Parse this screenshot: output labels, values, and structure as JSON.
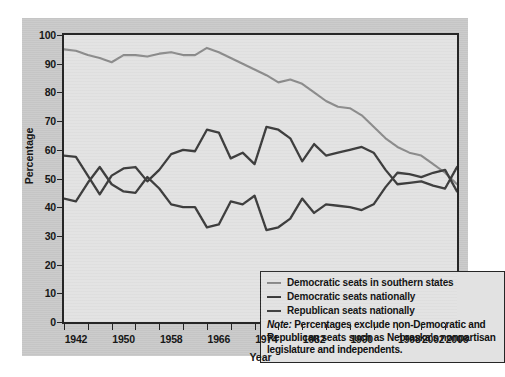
{
  "chart_data": {
    "type": "line",
    "title": "",
    "xlabel": "Year",
    "ylabel": "Percentage",
    "xlim": [
      1940,
      2006
    ],
    "ylim": [
      0,
      100
    ],
    "yticks": [
      0,
      10,
      20,
      30,
      40,
      50,
      60,
      70,
      80,
      90,
      100
    ],
    "ytick_labels": [
      "0",
      "10",
      "20",
      "30",
      "40",
      "50",
      "60",
      "70",
      "80",
      "90",
      "100"
    ],
    "xticks": [
      1940,
      1944,
      1948,
      1952,
      1956,
      1960,
      1964,
      1968,
      1972,
      1976,
      1980,
      1984,
      1988,
      1992,
      1996,
      2000,
      2004
    ],
    "xtick_labels": [
      {
        "year": 1942,
        "label": "1942"
      },
      {
        "year": 1950,
        "label": "1950"
      },
      {
        "year": 1958,
        "label": "1958"
      },
      {
        "year": 1966,
        "label": "1966"
      },
      {
        "year": 1974,
        "label": "1974"
      },
      {
        "year": 1982,
        "label": "1982"
      },
      {
        "year": 1990,
        "label": "1990"
      },
      {
        "year": 1998,
        "label": "1998"
      },
      {
        "year": 2002,
        "label": "2002"
      },
      {
        "year": 2006,
        "label": "2006"
      }
    ],
    "grid": false,
    "legend_position": "inside-bottom-right",
    "x": [
      1940,
      1942,
      1944,
      1946,
      1948,
      1950,
      1952,
      1954,
      1956,
      1958,
      1960,
      1962,
      1964,
      1966,
      1968,
      1970,
      1972,
      1974,
      1976,
      1978,
      1980,
      1982,
      1984,
      1986,
      1988,
      1990,
      1992,
      1994,
      1996,
      1998,
      2000,
      2002,
      2004,
      2006
    ],
    "series": [
      {
        "name": "Democratic seats in southern states",
        "color": "#8a8a8a",
        "values": [
          95,
          94.5,
          93,
          92,
          90.5,
          93,
          93,
          92.5,
          93.5,
          94,
          93,
          93,
          95.5,
          94,
          92,
          90,
          88,
          86,
          83.5,
          84.5,
          83,
          80,
          77,
          75,
          74.5,
          72,
          68,
          64,
          61,
          59,
          58,
          55,
          52,
          48
        ]
      },
      {
        "name": "Democratic seats nationally",
        "color": "#3a3a3a",
        "values": [
          58,
          57.5,
          51,
          44.5,
          51,
          53.5,
          54,
          49,
          53,
          58.5,
          60,
          59.5,
          67,
          66,
          57,
          59,
          55,
          68,
          67,
          64,
          56,
          62,
          58,
          59,
          60,
          61,
          59,
          53,
          48,
          48.5,
          49,
          47.5,
          46.5,
          54
        ]
      },
      {
        "name": "Republican seats nationally",
        "color": "#3a3a3a",
        "values": [
          43,
          42,
          48.5,
          54,
          48,
          45.5,
          45,
          50.5,
          46.5,
          41,
          40,
          40,
          33,
          34,
          42,
          41,
          44,
          32,
          33,
          36,
          43,
          38,
          41,
          40.5,
          40,
          39,
          41,
          47,
          52,
          51.5,
          50.5,
          52,
          53,
          45.5
        ]
      }
    ],
    "note_prefix": "Note:",
    "note_text": " Percentages exclude non-Democratic and Republican seats such as Nebraska's nonpartisan legislature and independents."
  },
  "legend": {
    "items": [
      "Democratic seats in southern states",
      "Democratic seats nationally",
      "Republican seats nationally"
    ]
  },
  "colors": {
    "page_background": "#ffffff",
    "panel_background": "#c9c9c9",
    "plot_background": "#e2e2e2",
    "frame": "#262626",
    "series_southern": "#8a8a8a",
    "series_dem": "#3a3a3a",
    "series_rep": "#3a3a3a",
    "text": "#171717"
  }
}
